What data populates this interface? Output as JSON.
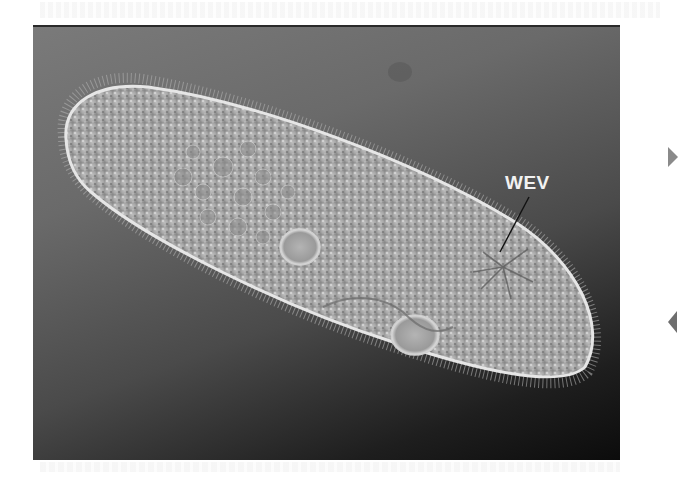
{
  "figure": {
    "annotations": [
      {
        "text": "WEV",
        "position": {
          "x": 505,
          "y": 170
        },
        "pointer_to": {
          "x": 500,
          "y": 250
        }
      }
    ]
  },
  "colors": {
    "background_light": "#7a7a7a",
    "background_dark": "#0c0c0c",
    "cell_body": "#c8c8c8",
    "label_text": "#f2f2f2",
    "page": "#ffffff"
  },
  "margin_icons": [
    {
      "name": "arrow-right-icon",
      "x": 668,
      "y": 147
    },
    {
      "name": "arrow-left-icon",
      "x": 668,
      "y": 311
    }
  ]
}
